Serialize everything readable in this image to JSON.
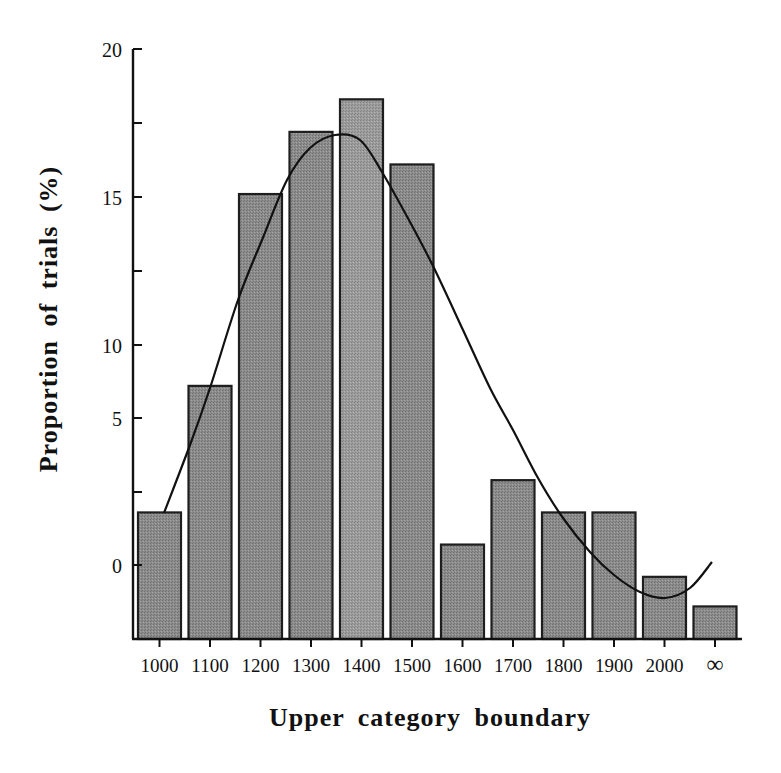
{
  "chart_data": {
    "type": "bar",
    "title": "",
    "xlabel": "Upper category boundary",
    "ylabel": "Proportion of trials (%)",
    "categories": [
      "1000",
      "1100",
      "1200",
      "1300",
      "1400",
      "1500",
      "1600",
      "1700",
      "1800",
      "1900",
      "2000",
      "∞"
    ],
    "values": [
      1.8,
      7.2,
      15.1,
      17.2,
      18.3,
      16.1,
      0.7,
      2.9,
      1.8,
      1.8,
      -0.4,
      -1.4
    ],
    "y_tick_labels": [
      "0",
      "5",
      "10",
      "15",
      "20"
    ],
    "y_tick_note": "Labeled ticks are unevenly spaced: 0 and 5 are two minor ticks apart, 5 and 10 one tick apart, 10-15 and 15-20 two ticks apart; bars extend below the '0' label to the baseline",
    "ylim": [
      -2.5,
      20
    ],
    "grid": false,
    "legend": null,
    "overlay": {
      "type": "line",
      "description": "smooth fitted curve over histogram",
      "x": [
        "1000",
        "1100",
        "1200",
        "1300",
        "1350",
        "1400",
        "1500",
        "1600",
        "1700",
        "1800",
        "1900",
        "2000",
        "2050"
      ],
      "values": [
        1.8,
        6.4,
        12.0,
        16.5,
        17.1,
        16.8,
        12.7,
        8.0,
        3.3,
        0.9,
        -0.2,
        -0.9,
        0.1
      ]
    }
  },
  "labels": {
    "ylabel": "Proportion of trials (%)",
    "xlabel": "Upper category boundary"
  },
  "colors": {
    "bar_fill": "#8a8a8a",
    "bar_fill_highlight": "#9a9a9a",
    "bar_stroke": "#1e1e1e",
    "axis": "#111111",
    "curve": "#111111"
  }
}
